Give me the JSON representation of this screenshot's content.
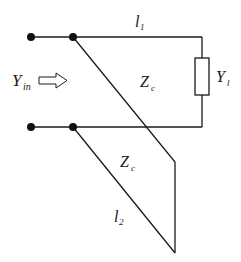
{
  "diagram": {
    "type": "circuit",
    "labels": {
      "input_admittance": {
        "main": "Y",
        "sub": "in"
      },
      "line1_length": {
        "main": "l",
        "sub": "1"
      },
      "line1_impedance": {
        "main": "Z",
        "sub": "c"
      },
      "load_admittance": {
        "main": "Y",
        "sub": "l"
      },
      "stub_impedance": {
        "main": "Z",
        "sub": "c"
      },
      "stub_length": {
        "main": "l",
        "sub": "2"
      }
    },
    "colors": {
      "line": "#1a1a1a",
      "node": "#111111",
      "background": "#ffffff"
    }
  }
}
